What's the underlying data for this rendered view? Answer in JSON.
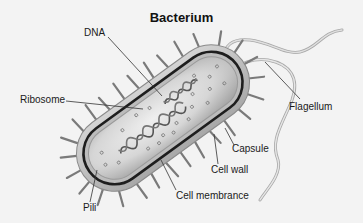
{
  "title": "Bacterium",
  "labels": {
    "dna": "DNA",
    "ribosome": "Ribosome",
    "flagellum": "Flagellum",
    "capsule": "Capsule",
    "cell_wall": "Cell wall",
    "cell_membrane": "Cell membrance",
    "pili": "Pili"
  },
  "colors": {
    "background": "#f3f3f3",
    "capsule_fill": "#c9c9c9",
    "cytoplasm_fill": "#d8d8d8",
    "cell_wall": "#2a2a2a",
    "pili": "#7a7a7a",
    "flagellum": "#bdbdbd",
    "leader_line": "#333333"
  }
}
